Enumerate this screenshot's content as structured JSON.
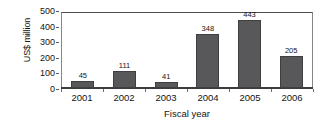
{
  "chart_data": {
    "type": "bar",
    "title": "",
    "subtitle": "",
    "xlabel": "Fiscal year",
    "ylabel": "US$ million",
    "categories": [
      "2001",
      "2002",
      "2003",
      "2004",
      "2005",
      "2006"
    ],
    "values": [
      45,
      111,
      41,
      348,
      443,
      205
    ],
    "value_labels": [
      "45",
      "111",
      "41",
      "348",
      "443",
      "205"
    ],
    "series": [
      {
        "name": "US$ million",
        "values": [
          45,
          111,
          41,
          348,
          443,
          205
        ]
      }
    ],
    "ylim": [
      0,
      500
    ],
    "yticks": [
      0,
      100,
      200,
      300,
      400,
      500
    ],
    "ytick_labels": [
      "0",
      "100",
      "200",
      "300",
      "400",
      "500"
    ],
    "xlim_categories": 6,
    "grid": false,
    "legend": false,
    "legend_position": "none",
    "bar_color": "#58585b",
    "bar_edge_color": "#3f3f42",
    "axis_color": "#4d4d4d",
    "background_color": "#ffffff",
    "text_color": "#141414",
    "data_labels_shown": true,
    "data_label_position": "above-bar"
  }
}
